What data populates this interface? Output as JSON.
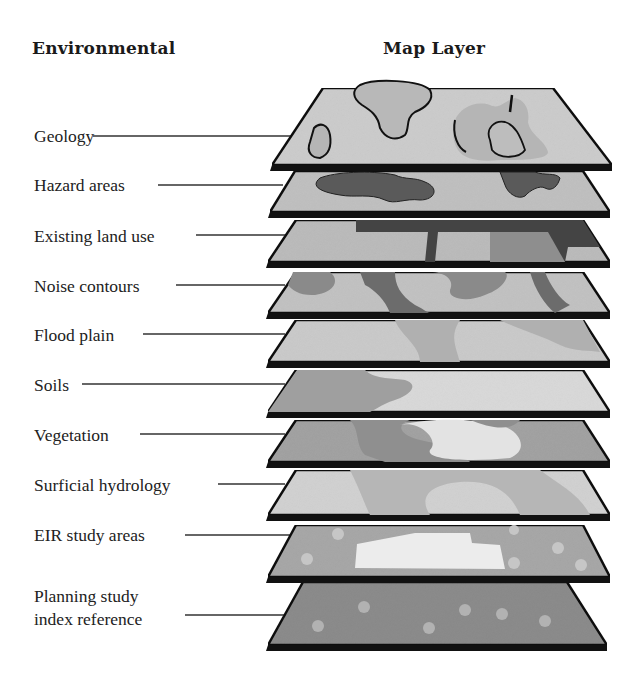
{
  "headings": {
    "left": "Environmental",
    "right": "Map Layer"
  },
  "layers": [
    {
      "label": "Geology",
      "fill": "#c4c4c4"
    },
    {
      "label": "Hazard areas",
      "fill": "#bdbdbd"
    },
    {
      "label": "Existing land use",
      "fill": "#bcbcbc"
    },
    {
      "label": "Noise contours",
      "fill": "#a9a9a9"
    },
    {
      "label": "Flood plain",
      "fill": "#c6c6c6"
    },
    {
      "label": "Soils",
      "fill": "#bababa"
    },
    {
      "label": "Vegetation",
      "fill": "#a3a3a3"
    },
    {
      "label": "Surficial hydrology",
      "fill": "#cfcfcf"
    },
    {
      "label": "EIR study areas",
      "fill": "#a8a8a8"
    },
    {
      "label": "Planning study",
      "label_line2": "index reference",
      "fill": "#8c8c8c"
    }
  ]
}
